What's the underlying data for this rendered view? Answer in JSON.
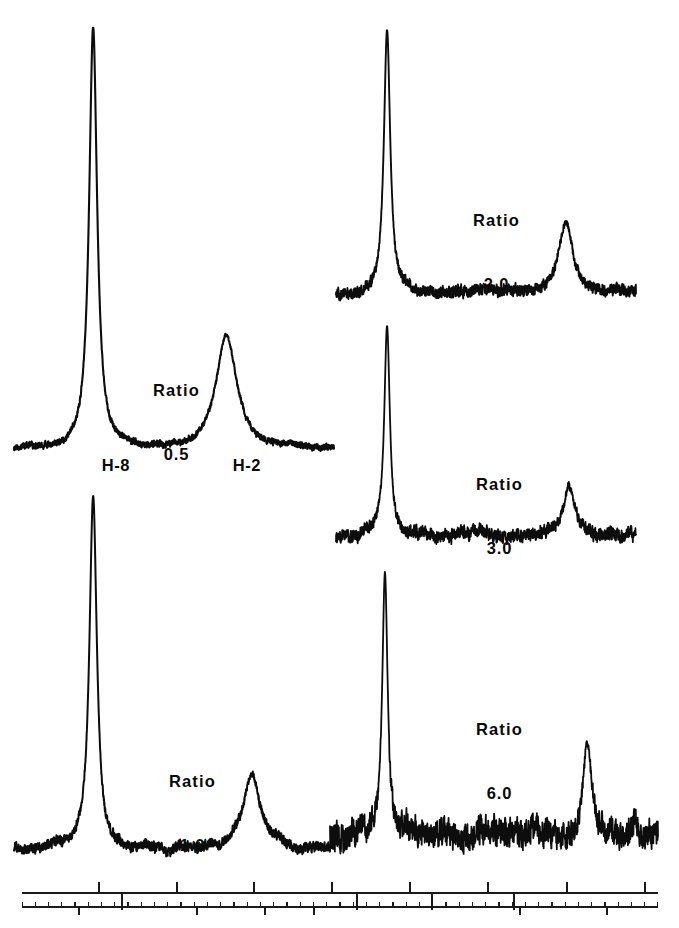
{
  "figure": {
    "kind": "nmr-spectra-panel-figure",
    "background": "#ffffff",
    "ink_color": "#0d0d0d",
    "width": 679,
    "height": 928
  },
  "peak_labels": {
    "h8": "H-8",
    "h2": "H-2",
    "ratio_word": "Ratio"
  },
  "panels": [
    {
      "id": "ratio-0-5",
      "ratio_word": "Ratio",
      "ratio_value": "0.5",
      "column": "left",
      "row": 1,
      "has_peak_labels": true,
      "h8_label": "H-8",
      "h2_label": "H-2"
    },
    {
      "id": "ratio-1-0",
      "ratio_word": "Ratio",
      "ratio_value": "1.0",
      "column": "left",
      "row": 2,
      "has_peak_labels": false
    },
    {
      "id": "ratio-2-0",
      "ratio_word": "Ratio",
      "ratio_value": "2.0",
      "column": "right",
      "row": 1,
      "has_peak_labels": false
    },
    {
      "id": "ratio-3-0",
      "ratio_word": "Ratio",
      "ratio_value": "3.0",
      "column": "right",
      "row": 2,
      "has_peak_labels": false
    },
    {
      "id": "ratio-6-0",
      "ratio_word": "Ratio",
      "ratio_value": "6.0",
      "column": "right",
      "row": 3,
      "has_peak_labels": false
    }
  ],
  "chart_data": {
    "type": "line",
    "title": "",
    "xlabel": "",
    "ylabel": "",
    "grid": false,
    "legend": "none",
    "series": [
      {
        "name": "Ratio 0.5",
        "ratio": 0.5,
        "peaks": [
          {
            "label": "H-8",
            "center_frac": 0.285,
            "height": 1.0,
            "halfwidth_frac": 0.028,
            "noise": 0.012
          },
          {
            "label": "H-2",
            "center_frac": 0.672,
            "height": 0.27,
            "halfwidth_frac": 0.072,
            "noise": 0.012
          }
        ],
        "baseline_noise": 0.012
      },
      {
        "name": "Ratio 1.0",
        "ratio": 1.0,
        "peaks": [
          {
            "label": "H-8",
            "center_frac": 0.285,
            "height": 1.0,
            "halfwidth_frac": 0.026,
            "noise": 0.02
          },
          {
            "label": "H-2",
            "center_frac": 0.745,
            "height": 0.215,
            "halfwidth_frac": 0.062,
            "noise": 0.02
          }
        ],
        "baseline_noise": 0.02
      },
      {
        "name": "Ratio 2.0",
        "ratio": 2.0,
        "peaks": [
          {
            "label": "H-8",
            "center_frac": 0.175,
            "height": 1.0,
            "halfwidth_frac": 0.024,
            "noise": 0.035
          },
          {
            "label": "H-2",
            "center_frac": 0.735,
            "height": 0.27,
            "halfwidth_frac": 0.055,
            "noise": 0.035
          }
        ],
        "baseline_noise": 0.035
      },
      {
        "name": "Ratio 3.0",
        "ratio": 3.0,
        "peaks": [
          {
            "label": "H-8",
            "center_frac": 0.175,
            "height": 1.0,
            "halfwidth_frac": 0.021,
            "noise": 0.05
          },
          {
            "label": "H-2",
            "center_frac": 0.745,
            "height": 0.235,
            "halfwidth_frac": 0.042,
            "noise": 0.05
          }
        ],
        "baseline_noise": 0.05
      },
      {
        "name": "Ratio 6.0",
        "ratio": 6.0,
        "peaks": [
          {
            "label": "H-8",
            "center_frac": 0.175,
            "height": 1.0,
            "halfwidth_frac": 0.019,
            "noise": 0.085
          },
          {
            "label": "H-2",
            "center_frac": 0.775,
            "height": 0.35,
            "halfwidth_frac": 0.031,
            "noise": 0.085
          }
        ],
        "baseline_noise": 0.085
      }
    ],
    "ratios": [
      0.5,
      1.0,
      2.0,
      3.0,
      6.0
    ],
    "scalebar": {
      "present": true,
      "rows": 2,
      "tick_labels": [],
      "upper_major_ticks": 8,
      "lower_minor_ticks": 48,
      "note": "Two-row calibration / frequency scale with major and minor ticks; no numeric tick labels printed."
    }
  }
}
